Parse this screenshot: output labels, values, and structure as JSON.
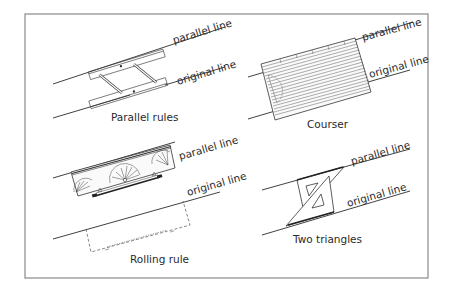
{
  "figure": {
    "frame": {
      "border_color": "#8a8a8a",
      "background": "#ffffff"
    },
    "panels": [
      {
        "id": "parallel-rules",
        "caption": "Parallel rules",
        "top_label": "parallel line",
        "bottom_label": "original line"
      },
      {
        "id": "courser",
        "caption": "Courser",
        "top_label": "parallel line",
        "bottom_label": "original line"
      },
      {
        "id": "rolling-rule",
        "caption": "Rolling rule",
        "top_label": "parallel line",
        "bottom_label": "original line"
      },
      {
        "id": "two-triangles",
        "caption": "Two triangles",
        "top_label": "parallel line",
        "bottom_label": "original line"
      }
    ],
    "line_color": "#2b2b2b",
    "text_color": "#2a2a2a"
  }
}
